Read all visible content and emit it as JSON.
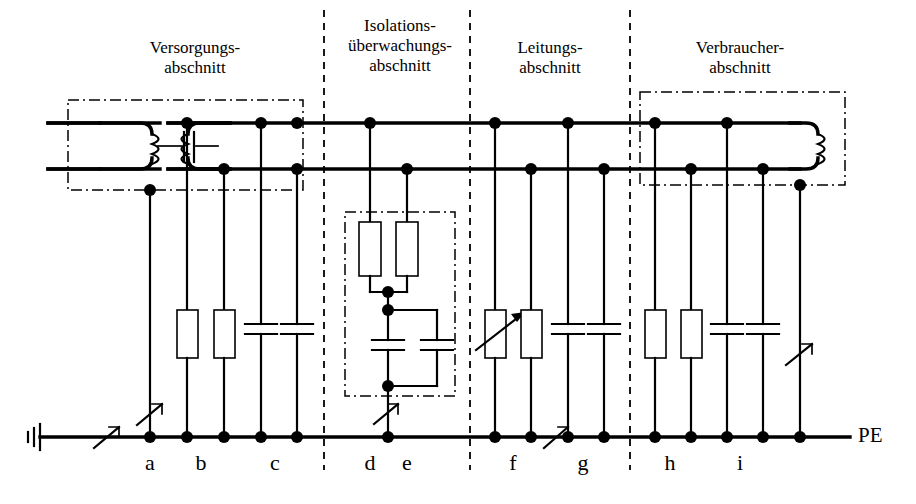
{
  "diagram": {
    "title_present": false,
    "ground_rail_label": "PE",
    "sections": [
      {
        "id": "versorgung",
        "label": "Versorgungs-\nabschnitt",
        "x": 80,
        "y": 38,
        "w": 230
      },
      {
        "id": "isolation",
        "label": "Isolations-\nüberwachungs-\nabschnitt",
        "x": 330,
        "y": 16,
        "w": 140
      },
      {
        "id": "leitung",
        "label": "Leitungs-\nabschnitt",
        "x": 480,
        "y": 38,
        "w": 140
      },
      {
        "id": "verbraucher",
        "label": "Verbraucher-\nabschnitt",
        "x": 645,
        "y": 38,
        "w": 190
      }
    ],
    "branch_labels": [
      {
        "id": "a",
        "label": "a",
        "x": 150
      },
      {
        "id": "b",
        "label": "b",
        "x": 201
      },
      {
        "id": "c",
        "label": "c",
        "x": 275
      },
      {
        "id": "d",
        "label": "d",
        "x": 370
      },
      {
        "id": "e",
        "label": "e",
        "x": 407
      },
      {
        "id": "f",
        "label": "f",
        "x": 513
      },
      {
        "id": "g",
        "label": "g",
        "x": 583
      },
      {
        "id": "h",
        "label": "h",
        "x": 670
      },
      {
        "id": "i",
        "label": "i",
        "x": 740
      }
    ],
    "components": {
      "supply_transformer": "two-winding-transformer",
      "coupling_capacitor": "capacitor",
      "load_coil": "load-winding",
      "resistors_total": 8,
      "capacitors_total": 8,
      "variable_resistor_branch": "f",
      "fault_arrows": 5
    },
    "colors": {
      "line": "#000000",
      "background": "#ffffff"
    }
  }
}
